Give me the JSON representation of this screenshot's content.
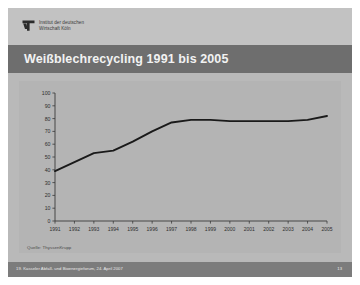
{
  "slide": {
    "logo": {
      "icon": "iw-koeln-logo-icon",
      "line1": "Institut der deutschen",
      "line2": "Wirtschaft Köln"
    },
    "title": "Weißblechrecycling 1991 bis 2005",
    "source_note": "Quelle: ThyssenKrupp",
    "footer": {
      "event": "19. Kasseler Abfall- und Bioenergieforum, 24. April 2007",
      "page": "13"
    },
    "colors": {
      "slide_background": "#b9b9b9",
      "header_band": "#c2c2c2",
      "title_bar": "#6e6e6e",
      "title_text": "#f2f2f2",
      "chart_panel": "#b4b4b4",
      "line": "#1a1a1a",
      "axis": "#3a3a3a",
      "footer_bar": "#7c7c7c"
    }
  },
  "chart_data": {
    "type": "line",
    "title": "Weißblechrecycling 1991 bis 2005",
    "xlabel": "",
    "ylabel": "",
    "ylim": [
      0,
      100
    ],
    "yticks": [
      0,
      10,
      20,
      30,
      40,
      50,
      60,
      70,
      80,
      90,
      100
    ],
    "grid": false,
    "legend": "none",
    "categories": [
      "1991",
      "1992",
      "1993",
      "1994",
      "1995",
      "1996",
      "1997",
      "1998",
      "1999",
      "2000",
      "2001",
      "2002",
      "2003",
      "2004",
      "2005"
    ],
    "series": [
      {
        "name": "Weißblechrecyclingquote",
        "values": [
          39,
          46,
          53,
          55,
          62,
          70,
          77,
          79,
          79,
          78,
          78,
          78,
          78,
          79,
          82
        ]
      }
    ],
    "annotations": [
      "Quelle: ThyssenKrupp"
    ]
  }
}
